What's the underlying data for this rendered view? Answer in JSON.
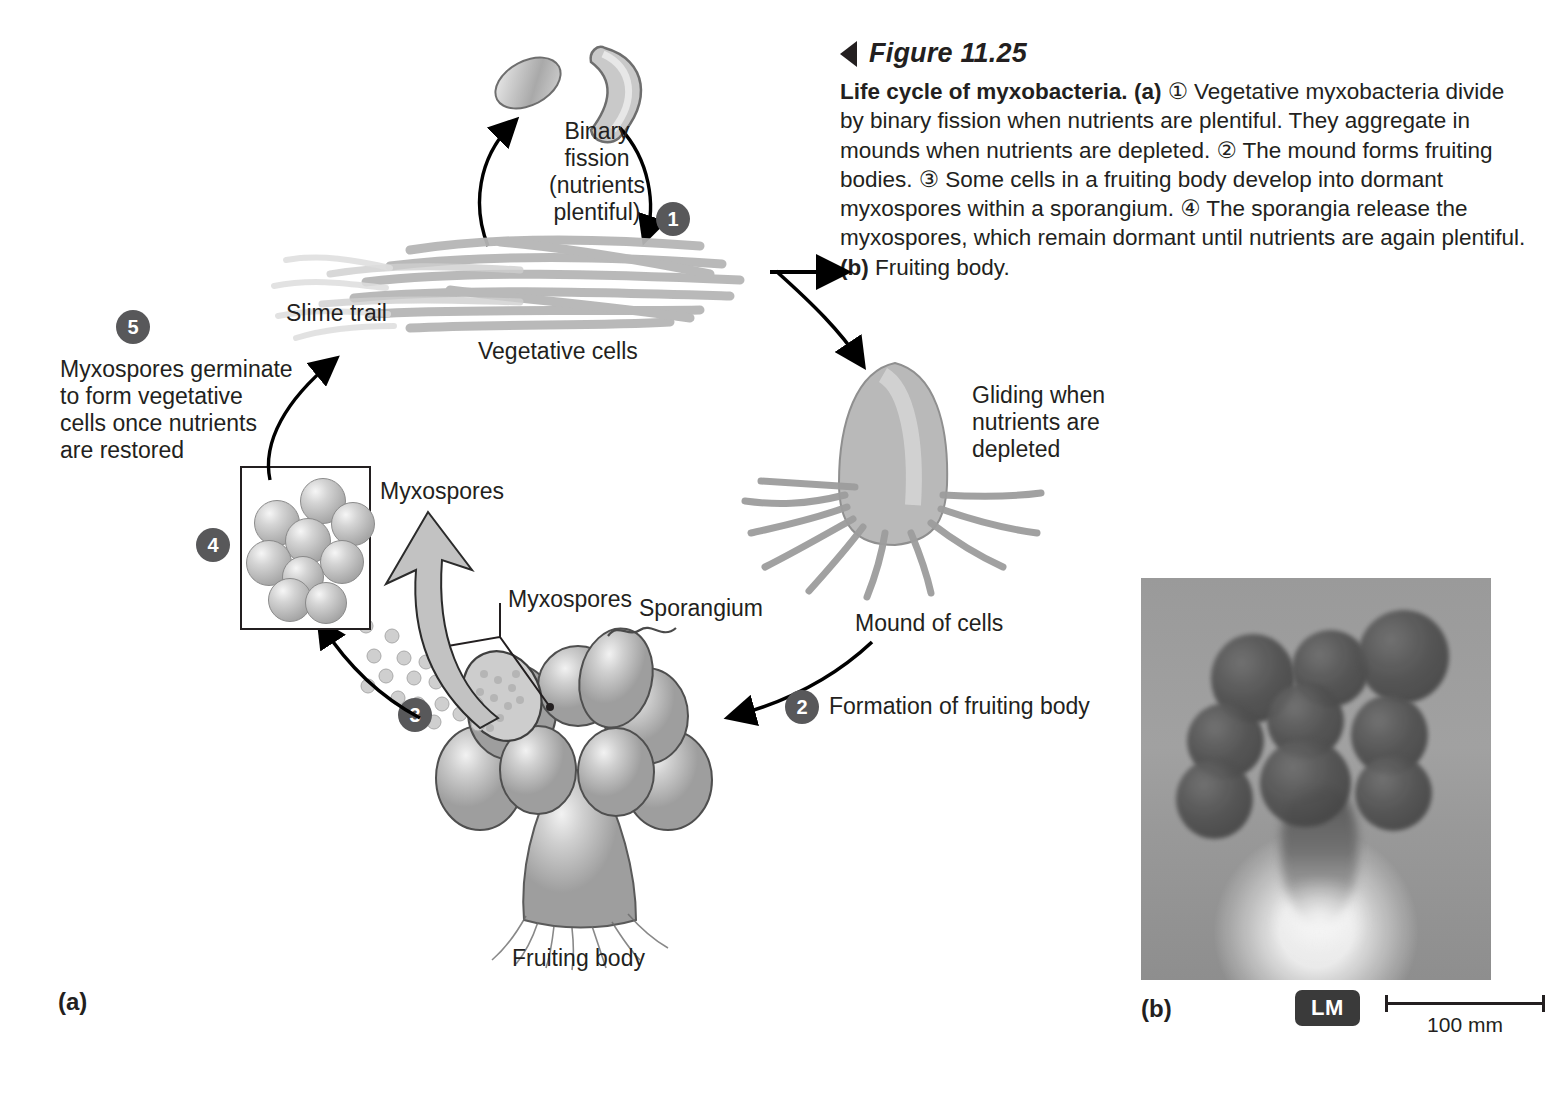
{
  "figure": {
    "number_label": "Figure 11.25",
    "marker_icon": "left-triangle-icon",
    "caption_bold_lead": "Life cycle of myxobacteria.",
    "part_a_marker": "(a)",
    "caption_text_1": " ① Vegetative myxobacteria divide by binary fission when nutrients are plentiful. They aggregate in mounds when nutrients are depleted. ② The mound forms fruiting bodies. ③ Some cells in a fruiting body develop into dormant myxospores within a sporangium. ④ The sporangia release the myxospores, which remain dormant until nutrients are again plentiful. ",
    "part_b_marker": "(b)",
    "caption_text_2": " Fruiting body."
  },
  "panels": {
    "a_label": "(a)",
    "b_label": "(b)"
  },
  "steps": {
    "one": "1",
    "two": "2",
    "three": "3",
    "four": "4",
    "five": "5"
  },
  "diagram_labels": {
    "binary_fission": "Binary\nfission\n(nutrients\nplentiful)",
    "vegetative_cells": "Vegetative cells",
    "slime_trail": "Slime trail",
    "gliding": "Gliding when\nnutrients are\ndepleted",
    "mound_of_cells": "Mound of cells",
    "formation_of_fruiting_body": "Formation of fruiting body",
    "myxospores_release": "Myxospores",
    "sporangium": "Sporangium",
    "fruiting_body": "Fruiting body",
    "myxospores_box": "Myxospores",
    "germinate": "Myxospores germinate\nto form vegetative\ncells once nutrients\nare restored"
  },
  "micrograph": {
    "technique_badge": "LM",
    "scale_bar_label": "100 mm"
  },
  "colors": {
    "text": "#231f20",
    "badge_fill": "#58585a",
    "badge_text": "#ffffff",
    "cell_gray": "#a9a9a9",
    "micrograph_bg": "#9b9b9b"
  }
}
